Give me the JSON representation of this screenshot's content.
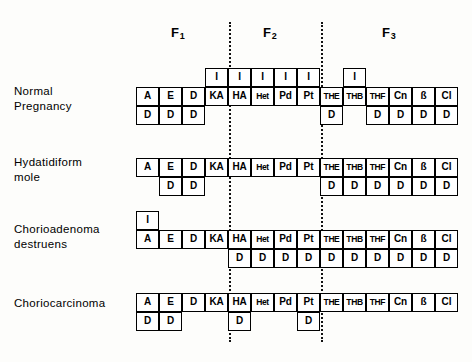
{
  "figure": {
    "fraction_headers": [
      {
        "name": "F1",
        "base": "F",
        "sub": "1",
        "x": 171,
        "y": 25
      },
      {
        "name": "F2",
        "base": "F",
        "sub": "2",
        "x": 263,
        "y": 25
      },
      {
        "name": "F3",
        "base": "F",
        "sub": "3",
        "x": 382,
        "y": 25
      }
    ],
    "dividers": [
      {
        "name": "divider-f1-f2",
        "x": 229
      },
      {
        "name": "divider-f2-f3",
        "x": 321
      }
    ],
    "columns": [
      "A",
      "E",
      "D",
      "KA",
      "HA",
      "Het",
      "Pd",
      "Pt",
      "THE",
      "THB",
      "THF",
      "Cn",
      "ß",
      "Cl"
    ],
    "column_x": [
      136,
      159,
      182,
      205,
      228,
      251,
      274,
      297,
      320,
      343,
      366,
      389,
      412,
      435
    ],
    "column_width": 23,
    "rows": [
      {
        "name": "normal-pregnancy",
        "label_lines": [
          "Normal",
          "Pregnancy"
        ],
        "label_x": 14,
        "label_y": 84,
        "top_y": 68,
        "mid_y": 87,
        "bot_y": 106,
        "top_cells": [
          {
            "col": 3,
            "text": "I"
          },
          {
            "col": 4,
            "text": "I"
          },
          {
            "col": 5,
            "text": "I"
          },
          {
            "col": 6,
            "text": "I"
          },
          {
            "col": 7,
            "text": "I"
          },
          {
            "col": 9,
            "text": "I"
          }
        ],
        "mid_cells": [
          {
            "col": 0,
            "text": "A"
          },
          {
            "col": 1,
            "text": "E"
          },
          {
            "col": 2,
            "text": "D"
          },
          {
            "col": 3,
            "text": "KA"
          },
          {
            "col": 4,
            "text": "HA"
          },
          {
            "col": 5,
            "text": "Het"
          },
          {
            "col": 6,
            "text": "Pd"
          },
          {
            "col": 7,
            "text": "Pt"
          },
          {
            "col": 8,
            "text": "THE"
          },
          {
            "col": 9,
            "text": "THB"
          },
          {
            "col": 10,
            "text": "THF"
          },
          {
            "col": 11,
            "text": "Cn"
          },
          {
            "col": 12,
            "text": "ß"
          },
          {
            "col": 13,
            "text": "Cl"
          }
        ],
        "bot_cells": [
          {
            "col": 0,
            "text": "D"
          },
          {
            "col": 1,
            "text": "D"
          },
          {
            "col": 2,
            "text": "D"
          },
          {
            "col": 8,
            "text": "D"
          },
          {
            "col": 10,
            "text": "D"
          },
          {
            "col": 11,
            "text": "D"
          },
          {
            "col": 12,
            "text": "D"
          },
          {
            "col": 13,
            "text": "D"
          }
        ]
      },
      {
        "name": "hydatidiform-mole",
        "label_lines": [
          "Hydatidiform",
          "mole"
        ],
        "label_x": 14,
        "label_y": 155,
        "top_y": 139,
        "mid_y": 158,
        "bot_y": 177,
        "top_cells": [],
        "mid_cells": [
          {
            "col": 0,
            "text": "A"
          },
          {
            "col": 1,
            "text": "E"
          },
          {
            "col": 2,
            "text": "D"
          },
          {
            "col": 3,
            "text": "KA"
          },
          {
            "col": 4,
            "text": "HA"
          },
          {
            "col": 5,
            "text": "Het"
          },
          {
            "col": 6,
            "text": "Pd"
          },
          {
            "col": 7,
            "text": "Pt"
          },
          {
            "col": 8,
            "text": "THE"
          },
          {
            "col": 9,
            "text": "THB"
          },
          {
            "col": 10,
            "text": "THF"
          },
          {
            "col": 11,
            "text": "Cn"
          },
          {
            "col": 12,
            "text": "ß"
          },
          {
            "col": 13,
            "text": "Cl"
          }
        ],
        "bot_cells": [
          {
            "col": 1,
            "text": "D"
          },
          {
            "col": 2,
            "text": "D"
          },
          {
            "col": 8,
            "text": "D"
          },
          {
            "col": 9,
            "text": "D"
          },
          {
            "col": 10,
            "text": "D"
          },
          {
            "col": 11,
            "text": "D"
          },
          {
            "col": 12,
            "text": "D"
          },
          {
            "col": 13,
            "text": "D"
          }
        ]
      },
      {
        "name": "chorioadenoma-destruens",
        "label_lines": [
          "Chorioadenoma",
          "destruens"
        ],
        "label_x": 14,
        "label_y": 222,
        "top_y": 211,
        "mid_y": 230,
        "bot_y": 249,
        "top_cells": [
          {
            "col": 0,
            "text": "I"
          }
        ],
        "mid_cells": [
          {
            "col": 0,
            "text": "A"
          },
          {
            "col": 1,
            "text": "E"
          },
          {
            "col": 2,
            "text": "D"
          },
          {
            "col": 3,
            "text": "KA"
          },
          {
            "col": 4,
            "text": "HA"
          },
          {
            "col": 5,
            "text": "Het"
          },
          {
            "col": 6,
            "text": "Pd"
          },
          {
            "col": 7,
            "text": "Pt"
          },
          {
            "col": 8,
            "text": "THE"
          },
          {
            "col": 9,
            "text": "THB"
          },
          {
            "col": 10,
            "text": "THF"
          },
          {
            "col": 11,
            "text": "Cn"
          },
          {
            "col": 12,
            "text": "ß"
          },
          {
            "col": 13,
            "text": "Cl"
          }
        ],
        "bot_cells": [
          {
            "col": 4,
            "text": "D"
          },
          {
            "col": 5,
            "text": "D"
          },
          {
            "col": 6,
            "text": "D"
          },
          {
            "col": 7,
            "text": "D"
          },
          {
            "col": 8,
            "text": "D"
          },
          {
            "col": 9,
            "text": "D"
          },
          {
            "col": 10,
            "text": "D"
          },
          {
            "col": 11,
            "text": "D"
          },
          {
            "col": 12,
            "text": "D"
          },
          {
            "col": 13,
            "text": "D"
          }
        ]
      },
      {
        "name": "choriocarcinoma",
        "label_lines": [
          "Choriocarcinoma"
        ],
        "label_x": 14,
        "label_y": 296,
        "top_y": 274,
        "mid_y": 293,
        "bot_y": 312,
        "top_cells": [],
        "mid_cells": [
          {
            "col": 0,
            "text": "A"
          },
          {
            "col": 1,
            "text": "E"
          },
          {
            "col": 2,
            "text": "D"
          },
          {
            "col": 3,
            "text": "KA"
          },
          {
            "col": 4,
            "text": "HA"
          },
          {
            "col": 5,
            "text": "Het"
          },
          {
            "col": 6,
            "text": "Pd"
          },
          {
            "col": 7,
            "text": "Pt"
          },
          {
            "col": 8,
            "text": "THE"
          },
          {
            "col": 9,
            "text": "THB"
          },
          {
            "col": 10,
            "text": "THF"
          },
          {
            "col": 11,
            "text": "Cn"
          },
          {
            "col": 12,
            "text": "ß"
          },
          {
            "col": 13,
            "text": "Cl"
          }
        ],
        "bot_cells": [
          {
            "col": 0,
            "text": "D"
          },
          {
            "col": 1,
            "text": "D"
          },
          {
            "col": 4,
            "text": "D"
          },
          {
            "col": 7,
            "text": "D"
          }
        ]
      }
    ]
  }
}
